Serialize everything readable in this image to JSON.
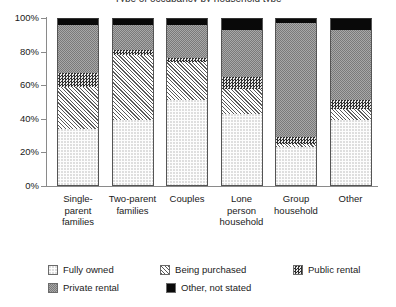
{
  "chart_data": {
    "type": "bar",
    "subtype": "stacked-percentage",
    "title": "Type of occupancy by household type",
    "xlabel": "",
    "ylabel": "",
    "ylim": [
      0,
      100
    ],
    "ytick_labels": [
      "0%",
      "20%",
      "40%",
      "60%",
      "80%",
      "100%"
    ],
    "ytick_values": [
      0,
      20,
      40,
      60,
      80,
      100
    ],
    "grid": false,
    "legend_position": "bottom",
    "categories": [
      "Single-parent families",
      "Two-parent families",
      "Couples",
      "Lone person household",
      "Group household",
      "Other"
    ],
    "category_lines": [
      [
        "Single-",
        "parent",
        "families"
      ],
      [
        "Two-parent",
        "families"
      ],
      [
        "Couples"
      ],
      [
        "Lone",
        "person",
        "household"
      ],
      [
        "Group",
        "household"
      ],
      [
        "Other"
      ]
    ],
    "series": [
      {
        "name": "Fully owned",
        "pattern": "light-dotted",
        "values": [
          34,
          39,
          51,
          43,
          23,
          39
        ]
      },
      {
        "name": "Being purchased",
        "pattern": "diagonal-hatch",
        "values": [
          25,
          39,
          23,
          15,
          2,
          7
        ]
      },
      {
        "name": "Public rental",
        "pattern": "dark-checker",
        "values": [
          8,
          3,
          2,
          7,
          4,
          5
        ]
      },
      {
        "name": "Private rental",
        "pattern": "gray-checker",
        "values": [
          29,
          15,
          20,
          28,
          68,
          42
        ]
      },
      {
        "name": "Other, not stated",
        "pattern": "solid-black",
        "values": [
          4,
          4,
          4,
          7,
          3,
          7
        ]
      }
    ]
  },
  "legend": {
    "row1": [
      "Fully owned",
      "Being purchased",
      "Public rental"
    ],
    "row2": [
      "Private rental",
      "Other, not stated"
    ]
  }
}
